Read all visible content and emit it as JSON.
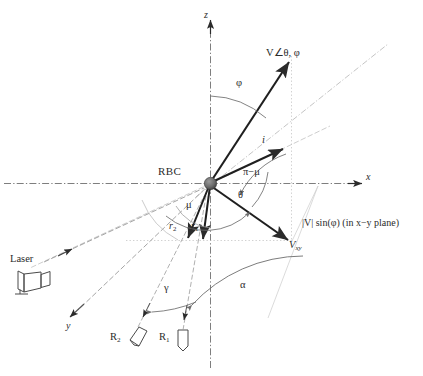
{
  "figure": {
    "type": "diagram",
    "background": "#ffffff",
    "ink": "#2b2b2b",
    "faint_ink": "#9a9a9a"
  },
  "axes": {
    "x_label": "x",
    "y_label": "y",
    "z_label": "z",
    "origin_label": "RBC"
  },
  "vectors": {
    "velocity_label": "V∠θ, φ",
    "incident_label": "i",
    "projection_label": "V",
    "projection_sub": "xy",
    "r1_label": "r",
    "r1_sub": "1",
    "r2_label": "r",
    "r2_sub": "2"
  },
  "angles": {
    "phi": "φ",
    "theta": "θ",
    "mu": "μ",
    "pi_minus_mu": "π−μ",
    "gamma": "γ",
    "alpha": "α"
  },
  "devices": {
    "laser_label": "Laser",
    "r1_detector_label": "R",
    "r1_detector_sub": "1",
    "r2_detector_label": "R",
    "r2_detector_sub": "2"
  },
  "annotations": {
    "projection_magnitude": "|V| sin(φ) (in x−y plane)"
  }
}
